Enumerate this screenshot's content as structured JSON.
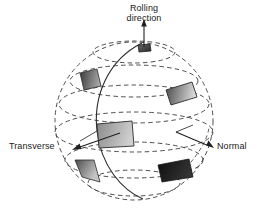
{
  "figure": {
    "title_alt": "Crystallographic orientation sphere with rolling, transverse and normal directions",
    "background_color": "#ffffff",
    "line_color": "#2b2b2b",
    "dash_color": "#3a3a3a"
  },
  "labels": {
    "rolling_line1": "Rolling",
    "rolling_line2": "direction",
    "transverse": "Transverse",
    "normal": "Normal"
  },
  "sphere": {
    "center_x": 134,
    "center_y": 121,
    "radius_x": 79,
    "radius_y": 79,
    "outline_style": "dashed",
    "latitude_count": 6,
    "meridian_style": "solid"
  },
  "axes": [
    {
      "name": "rolling-direction",
      "label": "Rolling direction",
      "direction": "up",
      "arrow_tip": [
        144,
        20
      ],
      "origin": [
        144,
        48
      ]
    },
    {
      "name": "transverse",
      "label": "Transverse",
      "direction": "left-down",
      "arrow_tip": [
        72,
        150
      ],
      "origin": [
        118,
        132
      ]
    },
    {
      "name": "normal",
      "label": "Normal",
      "direction": "right-down",
      "arrow_tip": [
        214,
        148
      ],
      "origin": [
        175,
        132
      ]
    }
  ],
  "patches": [
    {
      "name": "patch-pole",
      "position": "top-pole",
      "fill_from": "#6b6b6b",
      "fill_to": "#303030"
    },
    {
      "name": "patch-upper-left",
      "position": "upper-left",
      "fill_from": "#3d3d3d",
      "fill_to": "#9a9a9a"
    },
    {
      "name": "patch-upper-right",
      "position": "upper-right",
      "fill_from": "#4a4a4a",
      "fill_to": "#d6d6d6"
    },
    {
      "name": "patch-equator-left",
      "position": "equator-left",
      "fill_from": "#8e8e8e",
      "fill_to": "#c9c9c9"
    },
    {
      "name": "patch-lower-left",
      "position": "lower-left",
      "fill_from": "#4b4b4b",
      "fill_to": "#bdbdbd"
    },
    {
      "name": "patch-lower-right",
      "position": "lower-right",
      "fill_from": "#101010",
      "fill_to": "#2e2e2e"
    }
  ],
  "colors": {
    "stroke": "#2b2b2b",
    "text": "#1a1a1a",
    "background": "#ffffff"
  }
}
